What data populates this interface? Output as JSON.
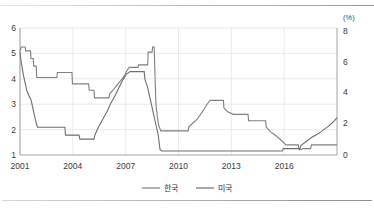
{
  "chart_data": {
    "type": "line",
    "title": "",
    "subtitle": "",
    "xlabel": "",
    "ylabel": "",
    "unit_label": "(%)",
    "grid": true,
    "legend_position": "bottom",
    "x_ticks": [
      "2001",
      "2004",
      "2007",
      "2010",
      "2013",
      "2016"
    ],
    "x_tick_values": [
      2001,
      2004,
      2007,
      2010,
      2013,
      2016
    ],
    "xlim": [
      2001,
      2019
    ],
    "left_axis": {
      "name": "한국",
      "ticks": [
        "1",
        "2",
        "3",
        "4",
        "5",
        "6"
      ],
      "tick_values": [
        1,
        2,
        3,
        4,
        5,
        6
      ],
      "ylim": [
        1,
        6
      ]
    },
    "right_axis": {
      "name": "미국",
      "ticks": [
        "0",
        "2",
        "4",
        "6",
        "8"
      ],
      "tick_values": [
        0,
        2,
        4,
        6,
        8
      ],
      "ylim": [
        0,
        8
      ]
    },
    "series": [
      {
        "name": "한국",
        "axis": "left",
        "color": "#808080",
        "points": [
          [
            2001.0,
            5.1
          ],
          [
            2001.08,
            5.25
          ],
          [
            2001.3,
            5.25
          ],
          [
            2001.32,
            5.1
          ],
          [
            2001.6,
            5.1
          ],
          [
            2001.62,
            4.8
          ],
          [
            2001.75,
            4.8
          ],
          [
            2001.78,
            4.5
          ],
          [
            2001.92,
            4.5
          ],
          [
            2001.95,
            4.05
          ],
          [
            2003.1,
            4.05
          ],
          [
            2003.12,
            4.25
          ],
          [
            2003.95,
            4.25
          ],
          [
            2003.98,
            3.8
          ],
          [
            2004.9,
            3.8
          ],
          [
            2004.93,
            3.55
          ],
          [
            2005.2,
            3.55
          ],
          [
            2005.23,
            3.25
          ],
          [
            2006.05,
            3.25
          ],
          [
            2006.08,
            3.4
          ],
          [
            2006.28,
            3.55
          ],
          [
            2006.45,
            3.7
          ],
          [
            2006.62,
            3.85
          ],
          [
            2006.8,
            4.0
          ],
          [
            2006.95,
            4.15
          ],
          [
            2007.05,
            4.3
          ],
          [
            2007.2,
            4.45
          ],
          [
            2007.7,
            4.45
          ],
          [
            2007.73,
            4.55
          ],
          [
            2008.25,
            4.55
          ],
          [
            2008.28,
            5.05
          ],
          [
            2008.5,
            5.05
          ],
          [
            2008.53,
            5.25
          ],
          [
            2008.62,
            5.25
          ],
          [
            2008.66,
            4.25
          ],
          [
            2008.72,
            3.0
          ],
          [
            2008.8,
            2.5
          ],
          [
            2008.88,
            2.15
          ],
          [
            2009.0,
            1.95
          ],
          [
            2010.55,
            1.95
          ],
          [
            2010.58,
            2.1
          ],
          [
            2010.8,
            2.25
          ],
          [
            2011.05,
            2.4
          ],
          [
            2011.25,
            2.6
          ],
          [
            2011.45,
            2.8
          ],
          [
            2011.62,
            3.0
          ],
          [
            2011.8,
            3.15
          ],
          [
            2012.55,
            3.15
          ],
          [
            2012.58,
            2.85
          ],
          [
            2012.8,
            2.7
          ],
          [
            2013.1,
            2.6
          ],
          [
            2013.95,
            2.6
          ],
          [
            2013.98,
            2.35
          ],
          [
            2014.95,
            2.35
          ],
          [
            2014.98,
            2.1
          ],
          [
            2015.25,
            1.9
          ],
          [
            2015.55,
            1.75
          ],
          [
            2015.8,
            1.6
          ],
          [
            2016.1,
            1.4
          ],
          [
            2016.8,
            1.4
          ],
          [
            2016.85,
            1.2
          ],
          [
            2017.1,
            1.25
          ],
          [
            2017.5,
            1.25
          ],
          [
            2017.55,
            1.4
          ],
          [
            2018.9,
            1.4
          ],
          [
            2019.0,
            1.4
          ]
        ]
      },
      {
        "name": "미국",
        "axis": "right",
        "color": "#6e6e6e",
        "points": [
          [
            2001.0,
            6.5
          ],
          [
            2001.05,
            6.0
          ],
          [
            2001.12,
            5.5
          ],
          [
            2001.2,
            5.0
          ],
          [
            2001.3,
            4.5
          ],
          [
            2001.4,
            4.0
          ],
          [
            2001.5,
            3.75
          ],
          [
            2001.62,
            3.5
          ],
          [
            2001.72,
            3.0
          ],
          [
            2001.82,
            2.5
          ],
          [
            2001.92,
            2.0
          ],
          [
            2002.0,
            1.75
          ],
          [
            2002.1,
            1.75
          ],
          [
            2003.55,
            1.75
          ],
          [
            2003.58,
            1.25
          ],
          [
            2004.35,
            1.25
          ],
          [
            2004.4,
            1.0
          ],
          [
            2005.15,
            1.0
          ],
          [
            2005.2,
            1.0
          ],
          [
            2005.25,
            1.25
          ],
          [
            2005.45,
            1.75
          ],
          [
            2005.7,
            2.25
          ],
          [
            2005.95,
            2.75
          ],
          [
            2006.15,
            3.25
          ],
          [
            2006.4,
            3.75
          ],
          [
            2006.62,
            4.25
          ],
          [
            2006.85,
            4.75
          ],
          [
            2007.05,
            5.1
          ],
          [
            2007.25,
            5.25
          ],
          [
            2008.05,
            5.25
          ],
          [
            2008.1,
            4.75
          ],
          [
            2008.25,
            4.25
          ],
          [
            2008.4,
            3.5
          ],
          [
            2008.55,
            2.75
          ],
          [
            2008.7,
            2.0
          ],
          [
            2008.85,
            1.25
          ],
          [
            2008.95,
            0.35
          ],
          [
            2009.05,
            0.25
          ],
          [
            2015.9,
            0.25
          ],
          [
            2015.95,
            0.4
          ],
          [
            2016.9,
            0.4
          ],
          [
            2016.95,
            0.6
          ],
          [
            2017.25,
            0.85
          ],
          [
            2017.55,
            1.1
          ],
          [
            2017.95,
            1.35
          ],
          [
            2018.25,
            1.6
          ],
          [
            2018.55,
            1.85
          ],
          [
            2018.85,
            2.15
          ],
          [
            2019.0,
            2.35
          ]
        ]
      }
    ]
  },
  "legend": {
    "items": [
      {
        "label": "한국",
        "color": "#808080"
      },
      {
        "label": "미국",
        "color": "#6e6e6e"
      }
    ]
  },
  "axes": {
    "unit": "(%)",
    "left_ticks": [
      "6",
      "5",
      "4",
      "3",
      "2",
      "1"
    ],
    "right_ticks": [
      "8",
      "6",
      "4",
      "2",
      "0"
    ],
    "x_ticks": [
      "2001",
      "2004",
      "2007",
      "2010",
      "2013",
      "2016"
    ]
  }
}
